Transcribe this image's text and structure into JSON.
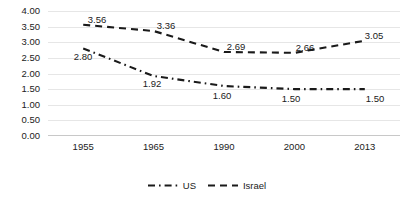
{
  "chart_data": {
    "type": "line",
    "title": "",
    "subtitle": "",
    "xlabel": "",
    "ylabel": "",
    "categories": [
      "1955",
      "1965",
      "1990",
      "2000",
      "2013"
    ],
    "ylim": [
      0.0,
      4.0
    ],
    "ytick_step": 0.5,
    "ytick_labels": [
      "4.00",
      "3.50",
      "3.00",
      "2.50",
      "2.00",
      "1.50",
      "1.00",
      "0.50",
      "0.00"
    ],
    "ytick_values": [
      4.0,
      3.5,
      3.0,
      2.5,
      2.0,
      1.5,
      1.0,
      0.5,
      0.0
    ],
    "grid": true,
    "legend_position": "bottom",
    "series": [
      {
        "name": "US",
        "line_style": "dash-dot",
        "color": "#1a1a1a",
        "values": [
          2.8,
          1.92,
          1.6,
          1.5,
          1.5
        ],
        "labels": [
          "2.80",
          "1.92",
          "1.60",
          "1.50",
          "1.50"
        ]
      },
      {
        "name": "Israel",
        "line_style": "dashed",
        "color": "#1a1a1a",
        "values": [
          3.56,
          3.36,
          2.69,
          2.66,
          3.05
        ],
        "labels": [
          "3.56",
          "3.36",
          "2.69",
          "2.66",
          "3.05"
        ]
      }
    ]
  },
  "legend": {
    "entries": [
      {
        "label": "US",
        "swatch_name": "legend-swatch-dash-dot"
      },
      {
        "label": "Israel",
        "swatch_name": "legend-swatch-dashed"
      }
    ]
  },
  "y_axis": {
    "t0": "4.00",
    "t1": "3.50",
    "t2": "3.00",
    "t3": "2.50",
    "t4": "2.00",
    "t5": "1.50",
    "t6": "1.00",
    "t7": "0.50",
    "t8": "0.00"
  },
  "x_axis": {
    "c0": "1955",
    "c1": "1965",
    "c2": "1990",
    "c3": "2000",
    "c4": "2013"
  },
  "israel_labels": {
    "p0": "3.56",
    "p1": "3.36",
    "p2": "2.69",
    "p3": "2.66",
    "p4": "3.05"
  },
  "us_labels": {
    "p0": "2.80",
    "p1": "1.92",
    "p2": "1.60",
    "p3": "1.50",
    "p4": "1.50"
  }
}
